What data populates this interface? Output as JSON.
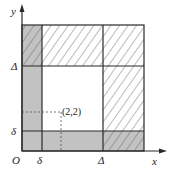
{
  "diagram": {
    "axes": {
      "x_label": "x",
      "y_label": "y",
      "origin_label": "O"
    },
    "ticks": {
      "x": [
        {
          "label": "δ",
          "pos": 42
        },
        {
          "label": "Δ",
          "pos": 103
        }
      ],
      "y": [
        {
          "label": "δ",
          "pos": 131
        },
        {
          "label": "Δ",
          "pos": 66
        }
      ]
    },
    "point": {
      "label": "(2,2)",
      "x": 61,
      "y": 112
    },
    "regions": [
      {
        "name": "left-strip",
        "fill": "gray",
        "x_range": "0..δ",
        "y_range": "0..Δ"
      },
      {
        "name": "bottom-strip",
        "fill": "gray",
        "x_range": "δ..Δ",
        "y_range": "0..δ"
      },
      {
        "name": "top-left-corner",
        "fill": "gray+hatch",
        "x_range": "0..δ",
        "y_range": "Δ..top"
      },
      {
        "name": "bottom-right-corner",
        "fill": "gray+hatch",
        "x_range": "Δ..right",
        "y_range": "0..δ"
      },
      {
        "name": "top-strip",
        "fill": "hatch",
        "x_range": "δ..right",
        "y_range": "Δ..top"
      },
      {
        "name": "right-strip",
        "fill": "hatch",
        "x_range": "Δ..right",
        "y_range": "δ..Δ"
      },
      {
        "name": "center",
        "fill": "white",
        "x_range": "δ..Δ",
        "y_range": "δ..Δ"
      }
    ],
    "colors": {
      "shade": "#c2c2c2",
      "line": "#2a2a2a",
      "hatch": "#555555",
      "background": "#ffffff"
    }
  }
}
